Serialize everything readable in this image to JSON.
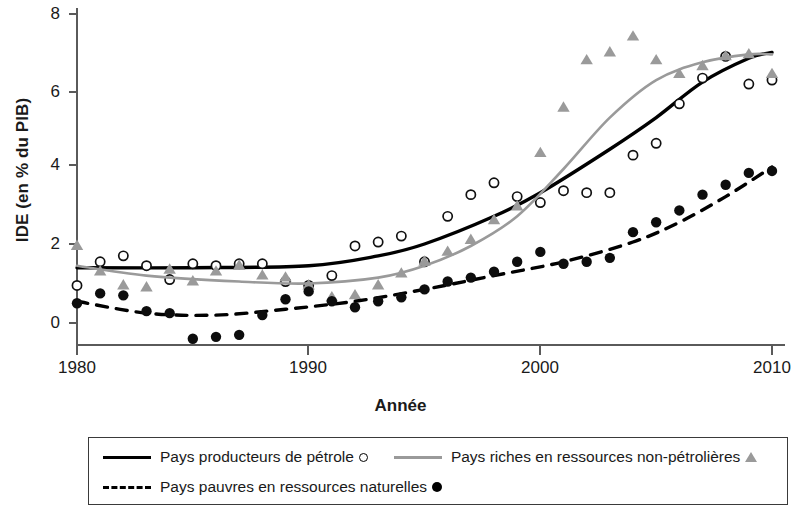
{
  "chart_data": {
    "type": "scatter",
    "title": "",
    "xlabel": "Année",
    "ylabel": "IDE (en % du PIB)",
    "xlim": [
      1980,
      2010
    ],
    "ylim": [
      -0.8,
      8.2
    ],
    "xticks": [
      1980,
      1990,
      2000,
      2010
    ],
    "xticklabels": [
      "1980",
      "1990",
      "2000",
      "2010"
    ],
    "yticks": [
      0,
      2,
      4,
      6,
      8
    ],
    "yticklabels": [
      "0",
      "2",
      "4",
      "6",
      "8"
    ],
    "grid": false,
    "legend_position": "bottom",
    "colors": {
      "oil_producers": "#000000",
      "resource_rich": "#9a9a9a",
      "resource_poor": "#000000",
      "axis": "#4a4a4a",
      "background": "#ffffff"
    },
    "series": [
      {
        "name": "Pays producteurs de pétrole",
        "marker": "open-circle",
        "line_style": "solid",
        "color": "#000000",
        "x": [
          1980,
          1981,
          1982,
          1983,
          1984,
          1985,
          1986,
          1987,
          1988,
          1989,
          1990,
          1991,
          1992,
          1993,
          1994,
          1995,
          1996,
          1997,
          1998,
          1999,
          2000,
          2001,
          2002,
          2003,
          2004,
          2005,
          2006,
          2007,
          2008,
          2009,
          2010
        ],
        "y": [
          0.95,
          1.55,
          1.7,
          1.45,
          1.1,
          1.5,
          1.45,
          1.5,
          1.5,
          1.05,
          0.95,
          1.2,
          1.95,
          2.05,
          2.2,
          1.55,
          2.7,
          3.25,
          3.55,
          3.2,
          3.05,
          3.35,
          3.3,
          3.3,
          4.25,
          4.55,
          5.55,
          6.2,
          6.75,
          6.05,
          6.15
        ],
        "fit_curve": [
          [
            1980,
            1.4
          ],
          [
            1985,
            1.4
          ],
          [
            1990,
            1.45
          ],
          [
            1993,
            1.7
          ],
          [
            1995,
            2.0
          ],
          [
            1998,
            2.7
          ],
          [
            2000,
            3.3
          ],
          [
            2003,
            4.4
          ],
          [
            2005,
            5.2
          ],
          [
            2007,
            6.1
          ],
          [
            2009,
            6.7
          ],
          [
            2010,
            6.85
          ]
        ]
      },
      {
        "name": "Pays riches en ressources non-pétrolières",
        "marker": "triangle",
        "line_style": "solid",
        "color": "#9a9a9a",
        "x": [
          1980,
          1981,
          1982,
          1983,
          1984,
          1985,
          1986,
          1987,
          1988,
          1989,
          1990,
          1991,
          1992,
          1993,
          1994,
          1995,
          1996,
          1997,
          1998,
          1999,
          2000,
          2001,
          2002,
          2003,
          2004,
          2005,
          2006,
          2007,
          2008,
          2009,
          2010
        ],
        "y": [
          1.95,
          1.3,
          0.95,
          0.9,
          1.35,
          1.05,
          1.3,
          1.45,
          1.2,
          1.15,
          0.95,
          0.65,
          0.7,
          0.95,
          1.25,
          1.55,
          1.8,
          2.1,
          2.6,
          2.95,
          4.3,
          5.45,
          6.65,
          6.85,
          7.25,
          6.65,
          6.3,
          6.5,
          6.75,
          6.8,
          6.3
        ],
        "fit_curve": [
          [
            1980,
            1.45
          ],
          [
            1983,
            1.2
          ],
          [
            1987,
            1.05
          ],
          [
            1990,
            1.0
          ],
          [
            1993,
            1.15
          ],
          [
            1995,
            1.45
          ],
          [
            1997,
            1.95
          ],
          [
            1999,
            2.7
          ],
          [
            2001,
            3.9
          ],
          [
            2003,
            5.2
          ],
          [
            2005,
            6.15
          ],
          [
            2007,
            6.6
          ],
          [
            2009,
            6.8
          ],
          [
            2010,
            6.8
          ]
        ]
      },
      {
        "name": "Pays pauvres en ressources naturelles",
        "marker": "filled-dot",
        "line_style": "dashed",
        "color": "#000000",
        "x": [
          1980,
          1981,
          1982,
          1983,
          1984,
          1985,
          1986,
          1987,
          1988,
          1989,
          1990,
          1991,
          1992,
          1993,
          1994,
          1995,
          1996,
          1997,
          1998,
          1999,
          2000,
          2001,
          2002,
          2003,
          2004,
          2005,
          2006,
          2007,
          2008,
          2009,
          2010
        ],
        "y": [
          0.5,
          0.75,
          0.7,
          0.3,
          0.25,
          -0.4,
          -0.35,
          -0.3,
          0.2,
          0.6,
          0.8,
          0.55,
          0.4,
          0.55,
          0.65,
          0.85,
          1.05,
          1.15,
          1.3,
          1.55,
          1.8,
          1.5,
          1.55,
          1.65,
          2.3,
          2.55,
          2.85,
          3.25,
          3.5,
          3.8,
          3.85
        ],
        "fit_curve": [
          [
            1980,
            0.55
          ],
          [
            1983,
            0.25
          ],
          [
            1986,
            0.2
          ],
          [
            1989,
            0.35
          ],
          [
            1992,
            0.55
          ],
          [
            1995,
            0.85
          ],
          [
            1998,
            1.2
          ],
          [
            2001,
            1.55
          ],
          [
            2004,
            2.05
          ],
          [
            2006,
            2.55
          ],
          [
            2008,
            3.2
          ],
          [
            2010,
            3.95
          ]
        ]
      }
    ]
  },
  "legend": {
    "rows": [
      {
        "items": [
          {
            "label": "Pays producteurs de pétrole",
            "line": "solid",
            "marker": "open-circle"
          },
          {
            "label": "Pays riches en ressources non-pétrolières",
            "line": "gray-solid",
            "marker": "triangle"
          }
        ]
      },
      {
        "items": [
          {
            "label": "Pays pauvres en ressources naturelles",
            "line": "dashed",
            "marker": "filled-dot"
          }
        ]
      }
    ]
  }
}
